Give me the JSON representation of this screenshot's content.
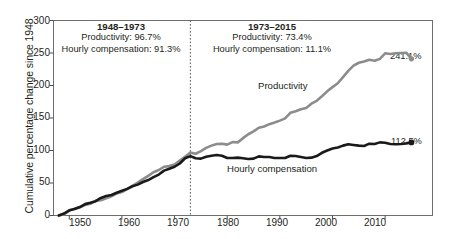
{
  "chart_data": {
    "type": "line",
    "title": "",
    "xlabel": "",
    "ylabel": "Cumulative percentage change since 1948",
    "xlim": [
      1947,
      2019
    ],
    "ylim": [
      0,
      300
    ],
    "xticks": [
      1950,
      1960,
      1970,
      1980,
      1990,
      2000,
      2010
    ],
    "yticks": [
      0,
      50,
      100,
      150,
      200,
      250,
      300
    ],
    "grid": false,
    "legend": "inline-labels",
    "divider_year": 1973,
    "series": [
      {
        "name": "Productivity",
        "color": "#8c8c8c",
        "end_label": "241.1%",
        "x": [
          1948,
          1949,
          1950,
          1951,
          1952,
          1953,
          1954,
          1955,
          1956,
          1957,
          1958,
          1959,
          1960,
          1961,
          1962,
          1963,
          1964,
          1965,
          1966,
          1967,
          1968,
          1969,
          1970,
          1971,
          1972,
          1973,
          1974,
          1975,
          1976,
          1977,
          1978,
          1979,
          1980,
          1981,
          1982,
          1983,
          1984,
          1985,
          1986,
          1987,
          1988,
          1989,
          1990,
          1991,
          1992,
          1993,
          1994,
          1995,
          1996,
          1997,
          1998,
          1999,
          2000,
          2001,
          2002,
          2003,
          2004,
          2005,
          2006,
          2007,
          2008,
          2009,
          2010,
          2011,
          2012,
          2013,
          2014,
          2015
        ],
        "y": [
          0,
          2.0,
          7.5,
          10.5,
          12.5,
          16.0,
          18.0,
          22.5,
          23.5,
          26.5,
          29.5,
          34.0,
          36.0,
          40.5,
          45.5,
          50.5,
          56.0,
          61.0,
          66.5,
          70.0,
          75.0,
          76.0,
          78.5,
          84.5,
          90.5,
          96.7,
          95.0,
          99.0,
          104.0,
          107.5,
          110.0,
          110.5,
          109.0,
          113.0,
          112.5,
          119.0,
          125.0,
          129.5,
          135.0,
          137.0,
          140.5,
          143.0,
          146.0,
          149.5,
          158.0,
          160.5,
          163.5,
          165.5,
          172.0,
          176.5,
          183.5,
          191.0,
          197.5,
          203.5,
          213.0,
          222.5,
          230.5,
          235.0,
          237.0,
          239.5,
          238.0,
          241.0,
          249.5,
          248.5,
          249.5,
          250.0,
          250.5,
          241.1
        ]
      },
      {
        "name": "Hourly compensation",
        "color": "#1a1a1a",
        "end_label": "112.5%",
        "x": [
          1948,
          1949,
          1950,
          1951,
          1952,
          1953,
          1954,
          1955,
          1956,
          1957,
          1958,
          1959,
          1960,
          1961,
          1962,
          1963,
          1964,
          1965,
          1966,
          1967,
          1968,
          1969,
          1970,
          1971,
          1972,
          1973,
          1974,
          1975,
          1976,
          1977,
          1978,
          1979,
          1980,
          1981,
          1982,
          1983,
          1984,
          1985,
          1986,
          1987,
          1988,
          1989,
          1990,
          1991,
          1992,
          1993,
          1994,
          1995,
          1996,
          1997,
          1998,
          1999,
          2000,
          2001,
          2002,
          2003,
          2004,
          2005,
          2006,
          2007,
          2008,
          2009,
          2010,
          2011,
          2012,
          2013,
          2014,
          2015
        ],
        "y": [
          0,
          3.0,
          8.0,
          10.0,
          13.0,
          17.5,
          19.5,
          22.0,
          27.0,
          30.0,
          31.5,
          35.0,
          38.0,
          41.0,
          45.0,
          47.5,
          51.5,
          54.5,
          59.0,
          63.0,
          69.0,
          72.0,
          75.0,
          80.0,
          88.0,
          91.3,
          88.0,
          87.5,
          90.5,
          92.0,
          93.0,
          92.0,
          88.5,
          88.5,
          89.0,
          88.0,
          87.0,
          87.5,
          91.0,
          90.0,
          90.0,
          88.5,
          88.5,
          88.5,
          92.0,
          91.5,
          90.0,
          88.5,
          89.0,
          91.5,
          96.5,
          100.0,
          103.0,
          104.5,
          107.5,
          109.5,
          108.5,
          107.5,
          107.0,
          110.5,
          110.0,
          112.5,
          112.0,
          110.0,
          109.5,
          110.0,
          111.0,
          112.5
        ]
      }
    ],
    "annotations": [
      {
        "id": "period-left",
        "heading": "1948–1973",
        "line1": "Productivity: 96.7%",
        "line2": "Hourly compensation: 91.3%"
      },
      {
        "id": "period-right",
        "heading": "1973–2015",
        "line1": "Productivity: 73.4%",
        "line2": "Hourly compensation: 11.1%"
      }
    ]
  }
}
